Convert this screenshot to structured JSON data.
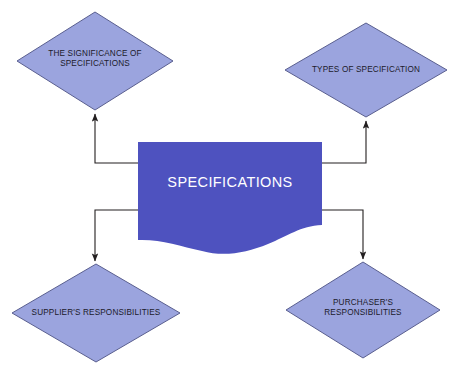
{
  "diagram": {
    "title_text": "SPECIFICATIONS",
    "type": "hub-and-spoke flowchart",
    "colors": {
      "center_fill": "#4e52bf",
      "diamond_fill": "#9ba4de",
      "diamond_stroke": "#5a5f8f",
      "connector_stroke": "#231f20",
      "center_text": "#ffffff",
      "diamond_text": "#1b1b2b",
      "background": "#ffffff"
    },
    "center_node": {
      "label": "SPECIFICATIONS",
      "shape": "wave-document",
      "x": 138,
      "y": 142,
      "width": 184,
      "height": 106
    },
    "nodes": [
      {
        "id": "significance",
        "label": "THE SIGNIFICANCE OF\nSPECIFICATIONS",
        "shape": "diamond",
        "position": "top-left",
        "cx": 95,
        "cy": 61,
        "rx": 78,
        "ry": 49
      },
      {
        "id": "types",
        "label": "TYPES OF SPECIFICATION",
        "shape": "diamond",
        "position": "top-right",
        "cx": 366,
        "cy": 70,
        "rx": 81,
        "ry": 47
      },
      {
        "id": "supplier",
        "label": "SUPPLIER'S RESPONSIBILITIES",
        "shape": "diamond",
        "position": "bottom-left",
        "cx": 96,
        "cy": 313,
        "rx": 84,
        "ry": 49
      },
      {
        "id": "purchaser",
        "label": "PURCHASER'S\nRESPONSIBILITIES",
        "shape": "diamond",
        "position": "bottom-right",
        "cx": 363,
        "cy": 310,
        "rx": 77,
        "ry": 48
      }
    ],
    "connectors": [
      {
        "id": "center-to-significance",
        "from": "center_node",
        "to": "significance",
        "arrow": "to",
        "direction": "left-then-up"
      },
      {
        "id": "center-to-types",
        "from": "center_node",
        "to": "types",
        "arrow": "to",
        "direction": "right-then-up"
      },
      {
        "id": "center-to-supplier",
        "from": "center_node",
        "to": "supplier",
        "arrow": "to",
        "direction": "left-then-down"
      },
      {
        "id": "center-to-purchaser",
        "from": "center_node",
        "to": "purchaser",
        "arrow": "to",
        "direction": "right-then-down"
      }
    ]
  }
}
